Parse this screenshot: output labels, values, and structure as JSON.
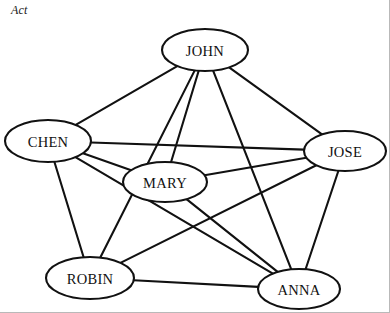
{
  "figure": {
    "caption": "Act",
    "background_color": "#ffffff",
    "line_color": "#111111",
    "node_fill": "#ffffff",
    "frame_color": "#b9b9b9"
  },
  "graph_data": {
    "type": "node-link-diagram",
    "title": "Act",
    "directed": false,
    "node_count": 6,
    "edge_count": 14,
    "node_shape": "ellipse",
    "nodes": [
      {
        "id": "john",
        "label": "JOHN",
        "cx": 205,
        "cy": 50,
        "rx": 43,
        "ry": 21,
        "degree": 5
      },
      {
        "id": "chen",
        "label": "CHEN",
        "cx": 48,
        "cy": 141,
        "rx": 43,
        "ry": 21,
        "degree": 5
      },
      {
        "id": "jose",
        "label": "JOSE",
        "cx": 345,
        "cy": 151,
        "rx": 41,
        "ry": 20,
        "degree": 5
      },
      {
        "id": "mary",
        "label": "MARY",
        "cx": 165,
        "cy": 182,
        "rx": 42,
        "ry": 20,
        "degree": 4
      },
      {
        "id": "robin",
        "label": "ROBIN",
        "cx": 90,
        "cy": 278,
        "rx": 44,
        "ry": 21,
        "degree": 5
      },
      {
        "id": "anna",
        "label": "ANNA",
        "cx": 299,
        "cy": 289,
        "rx": 41,
        "ry": 20,
        "degree": 5
      }
    ],
    "edges": [
      {
        "source": "john",
        "target": "chen"
      },
      {
        "source": "john",
        "target": "jose"
      },
      {
        "source": "john",
        "target": "mary"
      },
      {
        "source": "john",
        "target": "robin"
      },
      {
        "source": "john",
        "target": "anna"
      },
      {
        "source": "chen",
        "target": "jose"
      },
      {
        "source": "chen",
        "target": "mary"
      },
      {
        "source": "chen",
        "target": "robin"
      },
      {
        "source": "chen",
        "target": "anna"
      },
      {
        "source": "jose",
        "target": "mary"
      },
      {
        "source": "jose",
        "target": "robin"
      },
      {
        "source": "jose",
        "target": "anna"
      },
      {
        "source": "mary",
        "target": "anna"
      },
      {
        "source": "robin",
        "target": "anna"
      }
    ],
    "missing_edges": [
      {
        "source": "mary",
        "target": "robin"
      }
    ]
  }
}
